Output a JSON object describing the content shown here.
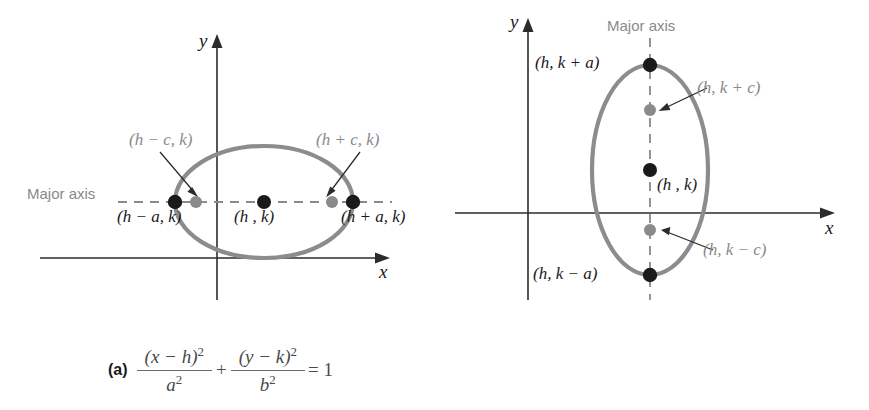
{
  "figure": {
    "panels": [
      {
        "id": "a",
        "tag": "(a)",
        "orientation": "horizontal-major-axis",
        "axis_labels": {
          "x": "x",
          "y": "y"
        },
        "major_axis_label": "Major axis",
        "points": [
          {
            "name": "left-vertex",
            "label": "(h − a, k)",
            "color": "#1a1a1a"
          },
          {
            "name": "left-focus",
            "label": "(h − c, k)",
            "color": "#8a8a8a"
          },
          {
            "name": "center",
            "label": "(h , k)",
            "color": "#1a1a1a"
          },
          {
            "name": "right-focus",
            "label": "(h + c, k)",
            "color": "#8a8a8a"
          },
          {
            "name": "right-vertex",
            "label": "(h + a, k)",
            "color": "#1a1a1a"
          }
        ],
        "equation": {
          "num1": "(x − h)",
          "den1": "a",
          "num2": "(y − k)",
          "den2": "b",
          "exp": "2",
          "op": "+",
          "eq": "= 1"
        }
      },
      {
        "id": "b",
        "tag": "(b)",
        "orientation": "vertical-major-axis",
        "axis_labels": {
          "x": "x",
          "y": "y"
        },
        "major_axis_label": "Major axis",
        "points": [
          {
            "name": "top-vertex",
            "label": "(h, k + a)",
            "color": "#1a1a1a"
          },
          {
            "name": "upper-focus",
            "label": "(h, k + c)",
            "color": "#8a8a8a"
          },
          {
            "name": "center",
            "label": "(h , k)",
            "color": "#1a1a1a"
          },
          {
            "name": "lower-focus",
            "label": "(h, k − c)",
            "color": "#8a8a8a"
          },
          {
            "name": "bottom-vertex",
            "label": "(h, k − a)",
            "color": "#1a1a1a"
          }
        ],
        "equation": {
          "num1": "(x − h)",
          "den1": "b",
          "num2": "(y − k)",
          "den2": "a",
          "exp": "2",
          "op": "+",
          "eq": "= 1"
        }
      }
    ],
    "colors": {
      "ellipse_stroke": "#8c8c8c",
      "axis_stroke": "#2b2b2b",
      "dashed_axis": "#8a8a8a",
      "vertex_dot": "#1a1a1a",
      "focus_dot": "#8a8a8a",
      "background": "#ffffff"
    }
  }
}
